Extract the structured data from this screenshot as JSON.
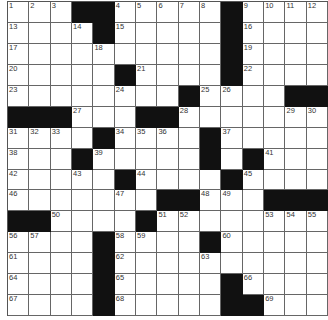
{
  "puzzle": {
    "rows": 15,
    "cols": 15,
    "colors": {
      "black": "#111111",
      "grid_line": "#666666",
      "white": "#ffffff",
      "number": "#333333"
    },
    "layout": [
      "...##.....#....",
      "....#.....#....",
      "..........#....",
      ".....#....#....",
      "........#....##",
      "###...##.......",
      "....#....#.....",
      "...#.....#.#...",
      ".....#....#....",
      ".......##...###",
      "##....#........",
      "....#....#.....",
      "....#..........",
      "....#.....#....",
      "....#.....##..."
    ],
    "numbers": [
      [
        1,
        2,
        3,
        null,
        null,
        4,
        5,
        6,
        7,
        8,
        null,
        9,
        10,
        11,
        12
      ],
      [
        13,
        null,
        null,
        14,
        null,
        15,
        null,
        null,
        null,
        null,
        null,
        16,
        null,
        null,
        null
      ],
      [
        17,
        null,
        null,
        null,
        18,
        null,
        null,
        null,
        null,
        null,
        null,
        19,
        null,
        null,
        null
      ],
      [
        20,
        null,
        null,
        null,
        null,
        null,
        21,
        null,
        null,
        null,
        null,
        22,
        null,
        null,
        null
      ],
      [
        23,
        null,
        null,
        null,
        null,
        24,
        null,
        null,
        null,
        25,
        26,
        null,
        null,
        null,
        null
      ],
      [
        null,
        null,
        null,
        27,
        null,
        null,
        null,
        null,
        28,
        null,
        null,
        null,
        null,
        29,
        30
      ],
      [
        31,
        32,
        33,
        null,
        null,
        34,
        35,
        36,
        null,
        null,
        37,
        null,
        null,
        null,
        null
      ],
      [
        38,
        null,
        null,
        null,
        39,
        null,
        null,
        null,
        null,
        40,
        null,
        null,
        41,
        null,
        null
      ],
      [
        42,
        null,
        null,
        43,
        null,
        null,
        44,
        null,
        null,
        null,
        null,
        45,
        null,
        null,
        null
      ],
      [
        46,
        null,
        null,
        null,
        null,
        47,
        null,
        null,
        null,
        48,
        49,
        null,
        null,
        null,
        null
      ],
      [
        null,
        null,
        50,
        null,
        null,
        null,
        null,
        51,
        52,
        null,
        null,
        null,
        53,
        54,
        55
      ],
      [
        56,
        57,
        null,
        null,
        null,
        58,
        59,
        null,
        null,
        null,
        60,
        null,
        null,
        null,
        null
      ],
      [
        61,
        null,
        null,
        null,
        null,
        62,
        null,
        null,
        null,
        63,
        null,
        null,
        null,
        null,
        null
      ],
      [
        64,
        null,
        null,
        null,
        null,
        65,
        null,
        null,
        null,
        null,
        null,
        66,
        null,
        null,
        null
      ],
      [
        67,
        null,
        null,
        null,
        null,
        68,
        null,
        null,
        null,
        null,
        null,
        null,
        69,
        null,
        null
      ]
    ]
  }
}
